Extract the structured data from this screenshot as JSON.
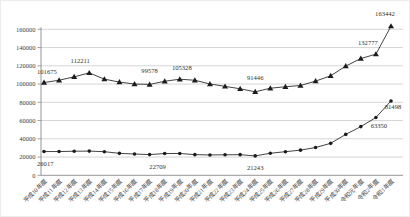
{
  "chart_data": {
    "type": "line",
    "title": "",
    "legend": "none",
    "grid": true,
    "background": "#ffffff",
    "colors": {
      "line": "#2e2e2e",
      "marker": "#1c1c1c",
      "grid": "#b8b8b8",
      "axis": "#8a8a8a",
      "text": "#3c3c3c"
    },
    "categories": [
      "平成10年度",
      "平成11年度",
      "平成12年度",
      "平成13年度",
      "平成14年度",
      "平成15年度",
      "平成16年度",
      "平成17年度",
      "平成18年度",
      "平成19年度",
      "平成20年度",
      "平成21年度",
      "平成22年度",
      "平成23年度",
      "平成24年度",
      "平成25年度",
      "平成26年度",
      "平成27年度",
      "平成28年度",
      "平成29年度",
      "平成30年度",
      "令和元年度",
      "令和2年度",
      "令和3年度"
    ],
    "y_axis": {
      "min": 0,
      "max": 160000,
      "tick_step": 20000,
      "ticks": [
        "0",
        "20000",
        "40000",
        "60000",
        "80000",
        "100000",
        "120000",
        "140000",
        "160000"
      ]
    },
    "series": [
      {
        "id": "upper-triangle-series",
        "marker": "triangle",
        "values": [
          101675,
          104180,
          107913,
          112211,
          105383,
          102149,
          100040,
          99578,
          103069,
          105328,
          104153,
          100105,
          97428,
          94836,
          91446,
          95442,
          97033,
          98408,
          103235,
          108999,
          119687,
          127922,
          132777,
          163442
        ],
        "labels": [
          {
            "index": 0,
            "text": "101675",
            "anchor": "start",
            "dx": -7,
            "dy": -9
          },
          {
            "index": 3,
            "text": "112211",
            "anchor": "middle",
            "dx": -9,
            "dy": -10
          },
          {
            "index": 7,
            "text": "99578",
            "anchor": "middle",
            "dx": 0,
            "dy": -11
          },
          {
            "index": 9,
            "text": "105328",
            "anchor": "middle",
            "dx": 2,
            "dy": -9
          },
          {
            "index": 14,
            "text": "91446",
            "anchor": "middle",
            "dx": 0,
            "dy": -12
          },
          {
            "index": 22,
            "text": "132777",
            "anchor": "middle",
            "dx": -8,
            "dy": -9
          },
          {
            "index": 23,
            "text": "163442",
            "anchor": "middle",
            "dx": -6,
            "dy": -10
          }
        ]
      },
      {
        "id": "lower-circle-series",
        "marker": "circle",
        "values": [
          26017,
          26047,
          26373,
          26511,
          25869,
          24077,
          23318,
          22709,
          23825,
          23926,
          22652,
          22327,
          22463,
          22622,
          21243,
          24175,
          25864,
          27583,
          30448,
          35032,
          44841,
          53350,
          63350,
          81498
        ],
        "labels": [
          {
            "index": 0,
            "text": "26017",
            "anchor": "start",
            "dx": -7,
            "dy": 14
          },
          {
            "index": 7,
            "text": "22709",
            "anchor": "middle",
            "dx": 8,
            "dy": 14
          },
          {
            "index": 14,
            "text": "21243",
            "anchor": "middle",
            "dx": 0,
            "dy": 14
          },
          {
            "index": 22,
            "text": "63350",
            "anchor": "middle",
            "dx": 3,
            "dy": 11
          },
          {
            "index": 23,
            "text": "81498",
            "anchor": "middle",
            "dx": 2,
            "dy": 8
          }
        ]
      }
    ]
  }
}
